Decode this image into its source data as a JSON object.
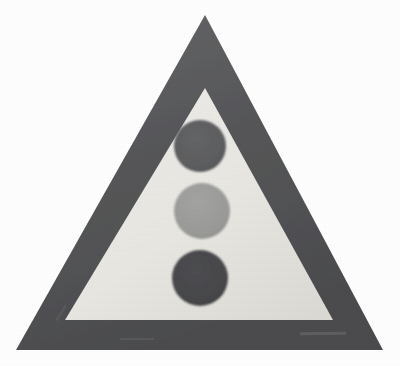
{
  "scene": {
    "kind": "photographed-road-sign",
    "title": "Traffic signals ahead warning sign",
    "description": "Triangular warning sign with dark border, pale inner field and three stacked traffic-light lamps",
    "width": 400,
    "height": 366,
    "background_color": "#ffffff"
  },
  "sign": {
    "shape": "triangle",
    "border_color": "#57585a",
    "border_shadow_color": "#4a4b4d",
    "border_highlight_color": "#6d6e70",
    "face_color": "#e8e7e2",
    "face_shadow_color": "#dddcd6",
    "outer_vertices": {
      "apex": {
        "x": 205,
        "y": 15
      },
      "bottom_left": {
        "x": 16,
        "y": 350
      },
      "bottom_right": {
        "x": 383,
        "y": 350
      }
    },
    "inner_vertices": {
      "apex": {
        "x": 205,
        "y": 88
      },
      "bottom_left": {
        "x": 65,
        "y": 320
      },
      "bottom_right": {
        "x": 333,
        "y": 320
      }
    },
    "border_thickness_px": 30
  },
  "lamps": [
    {
      "name": "top-lamp",
      "label": "red",
      "color": "#5c5d5f",
      "edge_color": "#515254",
      "cx": 200,
      "cy": 146,
      "r": 26
    },
    {
      "name": "middle-lamp",
      "label": "amber",
      "color": "#9a9b98",
      "edge_color": "#8d8e8b",
      "cx": 202,
      "cy": 211,
      "r": 28
    },
    {
      "name": "bottom-lamp",
      "label": "green",
      "color": "#46474a",
      "edge_color": "#3d3e41",
      "cx": 200,
      "cy": 278,
      "r": 28
    }
  ]
}
